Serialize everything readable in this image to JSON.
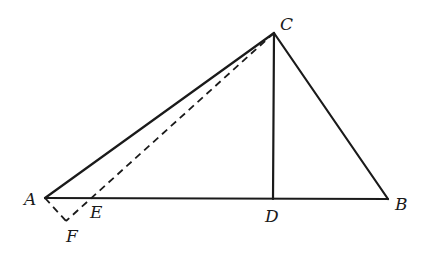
{
  "diagram": {
    "type": "geometry-triangle",
    "points": {
      "A": {
        "x": 45,
        "y": 198,
        "label": "A",
        "label_x": 24,
        "label_y": 205
      },
      "B": {
        "x": 388,
        "y": 199,
        "label": "B",
        "label_x": 395,
        "label_y": 210
      },
      "C": {
        "x": 274,
        "y": 33,
        "label": "C",
        "label_x": 280,
        "label_y": 30
      },
      "D": {
        "x": 273,
        "y": 199,
        "label": "D",
        "label_x": 265,
        "label_y": 222
      },
      "E": {
        "x": 95,
        "y": 198,
        "label": "E",
        "label_x": 90,
        "label_y": 218
      },
      "F": {
        "x": 66,
        "y": 221,
        "label": "F",
        "label_x": 66,
        "label_y": 242
      }
    },
    "segments_solid": [
      {
        "from": "A",
        "to": "B",
        "name": "segment-ab"
      },
      {
        "from": "A",
        "to": "C",
        "name": "segment-ac"
      },
      {
        "from": "B",
        "to": "C",
        "name": "segment-bc"
      },
      {
        "from": "C",
        "to": "D",
        "name": "segment-cd"
      }
    ],
    "segments_dashed": [
      {
        "from": "C",
        "to": "F",
        "name": "segment-cf"
      },
      {
        "from": "A",
        "to": "F",
        "name": "segment-af"
      }
    ],
    "labels": [
      "A",
      "B",
      "C",
      "D",
      "E",
      "F"
    ],
    "colors": {
      "stroke": "#1a1a1a",
      "background": "#ffffff"
    }
  }
}
